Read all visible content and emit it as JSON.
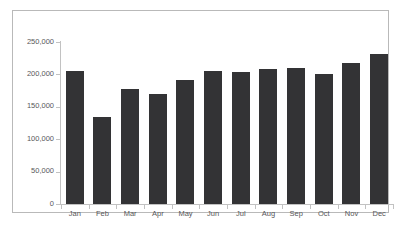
{
  "chart_data": {
    "type": "bar",
    "title": "",
    "subtitle": "",
    "xlabel": "",
    "ylabel": "",
    "categories": [
      "Jan",
      "Feb",
      "Mar",
      "Apr",
      "May",
      "Jun",
      "Jul",
      "Aug",
      "Sep",
      "Oct",
      "Nov",
      "Dec"
    ],
    "values": [
      205000,
      135000,
      178000,
      170000,
      192000,
      206000,
      203000,
      208000,
      210000,
      200000,
      217000,
      232000
    ],
    "ylim": [
      0,
      250000
    ],
    "ytick_values": [
      0,
      50000,
      100000,
      150000,
      200000,
      250000
    ],
    "ytick_labels": [
      "0",
      "50,000",
      "100,000",
      "150,000",
      "200,000",
      "250,000"
    ],
    "grid": false,
    "legend": false,
    "legend_position": "none",
    "series": [
      {
        "name": "",
        "values": [
          205000,
          135000,
          178000,
          170000,
          192000,
          206000,
          203000,
          208000,
          210000,
          200000,
          217000,
          232000
        ]
      }
    ]
  },
  "colors": {
    "bar": "#333335",
    "axis": "#c2c2c2",
    "tick_text": "#58585a",
    "frame_border": "#b9b9b9",
    "background": "#ffffff"
  }
}
